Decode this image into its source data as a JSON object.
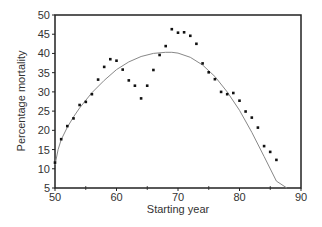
{
  "chart_data": {
    "type": "scatter",
    "title": "",
    "xlabel": "Starting year",
    "ylabel": "Percentage mortality",
    "xlim": [
      50,
      90
    ],
    "ylim": [
      5,
      50
    ],
    "xticks": [
      50,
      60,
      70,
      80,
      90
    ],
    "xminor_ticks": [
      55,
      65,
      75,
      85
    ],
    "yticks": [
      5,
      10,
      15,
      20,
      25,
      30,
      35,
      40,
      45,
      50
    ],
    "grid": false,
    "legend": null,
    "series": [
      {
        "name": "Observed",
        "kind": "scatter",
        "x": [
          50,
          51,
          52,
          53,
          54,
          55,
          56,
          57,
          58,
          59,
          60,
          61,
          62,
          63,
          64,
          65,
          66,
          67,
          68,
          69,
          70,
          71,
          72,
          73,
          74,
          75,
          76,
          77,
          78,
          79,
          80,
          81,
          82,
          83,
          84,
          85,
          86
        ],
        "y": [
          11.6,
          17.7,
          21.1,
          23.1,
          26.6,
          27.4,
          29.4,
          33.2,
          36.5,
          38.5,
          38.1,
          35.8,
          33.0,
          31.6,
          28.3,
          31.6,
          35.7,
          39.6,
          41.9,
          46.3,
          45.4,
          45.5,
          44.6,
          42.5,
          37.4,
          35.1,
          33.3,
          30.0,
          29.4,
          29.7,
          27.7,
          24.9,
          23.3,
          20.7,
          15.9,
          14.4,
          12.3
        ]
      },
      {
        "name": "Fitted curve",
        "kind": "line",
        "x": [
          50,
          50.5,
          51,
          52,
          53,
          54,
          56,
          58,
          60,
          62,
          64,
          66,
          68,
          69,
          70,
          72,
          74,
          76,
          78,
          80,
          82,
          84,
          86,
          87.7
        ],
        "y": [
          11.0,
          15.0,
          17.5,
          20.8,
          23.5,
          25.8,
          29.8,
          33.0,
          35.8,
          37.8,
          39.2,
          40.0,
          40.3,
          40.3,
          40.1,
          39.0,
          37.0,
          34.0,
          30.0,
          25.2,
          19.5,
          13.2,
          6.8,
          5.0
        ]
      }
    ]
  }
}
